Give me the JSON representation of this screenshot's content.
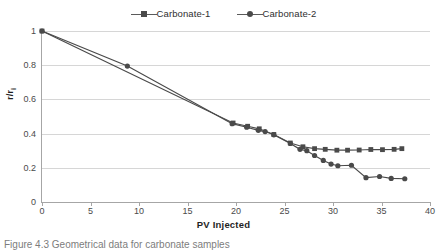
{
  "figure": {
    "caption": "Figure 4.3  Geometrical data for carbonate samples"
  },
  "legend": {
    "position": "top-center",
    "entries": [
      {
        "label": "Carbonate-1",
        "marker": "square",
        "color": "#4a4a4a"
      },
      {
        "label": "Carbonate-2",
        "marker": "circle",
        "color": "#4a4a4a"
      }
    ]
  },
  "axes": {
    "x_title": "PV Injected",
    "y_title_main": "r/r",
    "y_title_sub": "i",
    "x_ticks": [
      "0",
      "5",
      "10",
      "15",
      "20",
      "25",
      "30",
      "35",
      "40"
    ],
    "y_ticks": [
      "0",
      "0.2",
      "0.4",
      "0.6",
      "0.8",
      "1"
    ]
  },
  "chart_data": {
    "type": "line",
    "title": "",
    "xlabel": "PV Injected",
    "ylabel": "r/ri",
    "xlim": [
      0,
      40
    ],
    "ylim": [
      0,
      1
    ],
    "xticks": [
      0,
      5,
      10,
      15,
      20,
      25,
      30,
      35,
      40
    ],
    "yticks": [
      0,
      0.2,
      0.4,
      0.6,
      0.8,
      1
    ],
    "grid": "horizontal",
    "legend_position": "top-center",
    "series": [
      {
        "name": "Carbonate-1",
        "marker": "square",
        "color": "#4a4a4a",
        "points": [
          [
            0.0,
            1.0
          ],
          [
            19.7,
            0.462
          ],
          [
            21.2,
            0.443
          ],
          [
            22.4,
            0.428
          ],
          [
            23.9,
            0.395
          ],
          [
            25.6,
            0.345
          ],
          [
            26.9,
            0.323
          ],
          [
            28.1,
            0.312
          ],
          [
            29.2,
            0.308
          ],
          [
            30.4,
            0.303
          ],
          [
            31.5,
            0.303
          ],
          [
            32.7,
            0.304
          ],
          [
            33.9,
            0.307
          ],
          [
            35.1,
            0.306
          ],
          [
            36.3,
            0.308
          ],
          [
            37.1,
            0.312
          ]
        ]
      },
      {
        "name": "Carbonate-2",
        "marker": "circle",
        "color": "#4a4a4a",
        "points": [
          [
            0.0,
            1.0
          ],
          [
            8.8,
            0.795
          ],
          [
            19.6,
            0.458
          ],
          [
            21.1,
            0.437
          ],
          [
            22.3,
            0.419
          ],
          [
            23.0,
            0.412
          ],
          [
            23.9,
            0.393
          ],
          [
            25.6,
            0.342
          ],
          [
            26.6,
            0.308
          ],
          [
            27.3,
            0.3
          ],
          [
            28.1,
            0.272
          ],
          [
            29.0,
            0.243
          ],
          [
            29.8,
            0.222
          ],
          [
            30.5,
            0.212
          ],
          [
            31.9,
            0.215
          ],
          [
            33.4,
            0.142
          ],
          [
            34.8,
            0.149
          ],
          [
            36.0,
            0.138
          ],
          [
            37.4,
            0.136
          ]
        ]
      }
    ]
  }
}
